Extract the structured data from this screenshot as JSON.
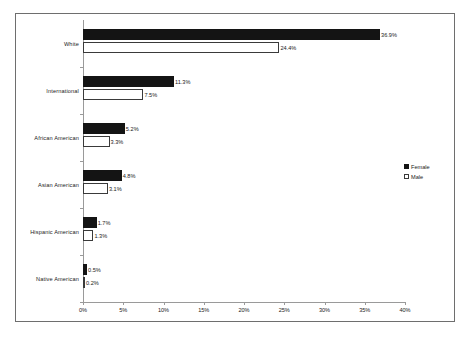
{
  "chart_data": {
    "type": "bar",
    "orientation": "horizontal",
    "title": "",
    "xlabel": "",
    "ylabel": "",
    "xlim": [
      0,
      40
    ],
    "xunit": "%",
    "grid": false,
    "legend_position": "right",
    "categories": [
      "White",
      "International",
      "African American",
      "Asian American",
      "Hispanic American",
      "Native American"
    ],
    "tick_labels": [
      "0%",
      "5%",
      "10%",
      "15%",
      "20%",
      "25%",
      "30%",
      "35%",
      "40%"
    ],
    "tick_values": [
      0,
      5,
      10,
      15,
      20,
      25,
      30,
      35,
      40
    ],
    "series": [
      {
        "name": "Female",
        "color": "#141414",
        "values": [
          36.9,
          11.3,
          5.2,
          4.8,
          1.7,
          0.5
        ],
        "labels": [
          "36.9%",
          "11.3%",
          "5.2%",
          "4.8%",
          "1.7%",
          "0.5%"
        ]
      },
      {
        "name": "Male",
        "color": "#ffffff",
        "values": [
          24.4,
          7.5,
          3.3,
          3.1,
          1.3,
          0.2
        ],
        "labels": [
          "24.4%",
          "7.5%",
          "3.3%",
          "3.1%",
          "1.3%",
          "0.2%"
        ]
      }
    ]
  },
  "legend": {
    "items": [
      {
        "label": "Female"
      },
      {
        "label": "Male"
      }
    ]
  }
}
